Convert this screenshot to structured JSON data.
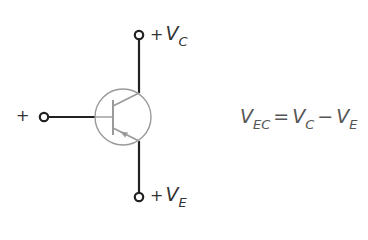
{
  "diagram": {
    "component": "pnp-bipolar-transistor",
    "terminals": {
      "collector": {
        "sign": "+",
        "symbol": "V",
        "subscript": "C"
      },
      "emitter": {
        "sign": "+",
        "symbol": "V",
        "subscript": "E"
      },
      "base": {
        "sign": "+"
      }
    },
    "equation": {
      "lhs_symbol": "V",
      "lhs_subscript": "EC",
      "equals": "=",
      "term1_symbol": "V",
      "term1_subscript": "C",
      "minus": "−",
      "term2_symbol": "V",
      "term2_subscript": "E"
    },
    "colors": {
      "wire": "#222222",
      "transistor_outline": "#9a9a9a",
      "text": "#444444"
    }
  }
}
